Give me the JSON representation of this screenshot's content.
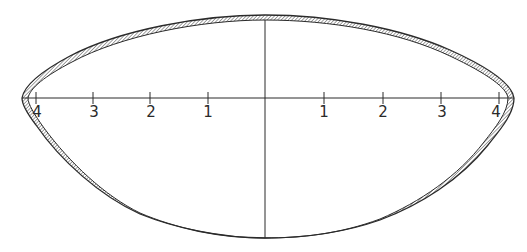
{
  "figure": {
    "type": "cross-section outline with hatched band",
    "colors": {
      "stroke": "#2a2a2a",
      "hatch": "#555555",
      "background": "#ffffff"
    },
    "axis": {
      "left_ticks": [
        {
          "label": "4",
          "x": 36
        },
        {
          "label": "3",
          "x": 93
        },
        {
          "label": "2",
          "x": 150
        },
        {
          "label": "1",
          "x": 208
        }
      ],
      "right_ticks": [
        {
          "label": "1",
          "x": 324
        },
        {
          "label": "2",
          "x": 383
        },
        {
          "label": "3",
          "x": 441
        },
        {
          "label": "4",
          "x": 499
        }
      ]
    }
  }
}
